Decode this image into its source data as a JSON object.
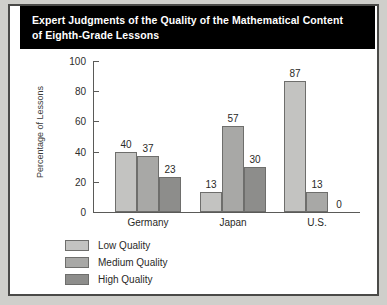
{
  "figure": {
    "title": "Expert Judgments of the Quality of the Mathematical Content\nof Eighth-Grade Lessons",
    "panel_background": "#ffffff",
    "border_color": "#4a4a48",
    "page_background": "#cfcfcb",
    "title_background": "#000000",
    "title_color": "#ffffff"
  },
  "chart_data": {
    "type": "bar",
    "title": "Expert Judgments of the Quality of the Mathematical Content of Eighth-Grade Lessons",
    "xlabel": "",
    "ylabel": "Percentage of Lessons",
    "categories": [
      "Germany",
      "Japan",
      "U.S."
    ],
    "series": [
      {
        "name": "Low Quality",
        "color": "#c3c3c1",
        "values": [
          40,
          13,
          87
        ]
      },
      {
        "name": "Medium Quality",
        "color": "#a8a8a6",
        "values": [
          37,
          57,
          13
        ]
      },
      {
        "name": "High Quality",
        "color": "#8d8d8b",
        "values": [
          23,
          30,
          0
        ]
      }
    ],
    "ylim": [
      0,
      100
    ],
    "yticks": [
      0,
      20,
      40,
      60,
      80,
      100
    ],
    "ytick_labels": [
      "0",
      "20",
      "40",
      "60",
      "80",
      "100"
    ],
    "grid": false,
    "legend_position": "bottom-left",
    "data_labels": true
  },
  "legend": {
    "items": [
      {
        "label": "Low Quality",
        "color": "#c3c3c1"
      },
      {
        "label": "Medium Quality",
        "color": "#a8a8a6"
      },
      {
        "label": "High Quality",
        "color": "#8d8d8b"
      }
    ]
  }
}
